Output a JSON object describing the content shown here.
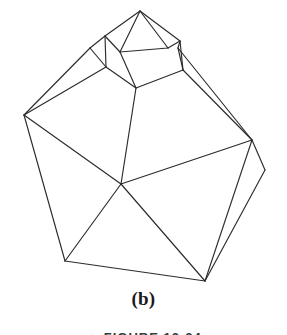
{
  "figure": {
    "caption": "(b)",
    "figure_reference": "▲ FIGURE 12-24",
    "line_color": "#2b2b2b",
    "background_color": "#ffffff",
    "stroke_width": 1.15
  },
  "geometry": {
    "type": "wireframe-polyhedron",
    "vertices": {
      "apex": [
        140,
        11
      ],
      "cap_left": [
        105,
        36
      ],
      "cap_right": [
        180,
        41
      ],
      "cap_front_left": [
        120,
        52
      ],
      "cap_front_right": [
        168,
        48
      ],
      "neck_left": [
        106,
        67
      ],
      "neck_right": [
        183,
        70
      ],
      "neck_front": [
        136,
        88
      ],
      "shoulder_left": [
        90,
        48
      ],
      "shoulder_right": [
        178,
        48
      ],
      "body_left": [
        24,
        115
      ],
      "body_right": [
        252,
        140
      ],
      "body_far_right": [
        265,
        170
      ],
      "center": [
        121,
        184
      ],
      "bottom_left": [
        65,
        261
      ],
      "bottom_right": [
        205,
        281
      ]
    },
    "edges": [
      [
        "apex",
        "cap_left"
      ],
      [
        "apex",
        "cap_right"
      ],
      [
        "apex",
        "cap_front_left"
      ],
      [
        "apex",
        "cap_front_right"
      ],
      [
        "cap_left",
        "cap_front_left"
      ],
      [
        "cap_front_left",
        "cap_front_right"
      ],
      [
        "cap_front_right",
        "cap_right"
      ],
      [
        "cap_left",
        "neck_left"
      ],
      [
        "cap_right",
        "neck_right"
      ],
      [
        "cap_front_left",
        "neck_front"
      ],
      [
        "neck_left",
        "neck_front"
      ],
      [
        "neck_front",
        "neck_right"
      ],
      [
        "cap_left",
        "shoulder_left"
      ],
      [
        "cap_right",
        "shoulder_right"
      ],
      [
        "shoulder_left",
        "neck_left"
      ],
      [
        "shoulder_right",
        "neck_right"
      ],
      [
        "shoulder_left",
        "body_left"
      ],
      [
        "shoulder_right",
        "body_right"
      ],
      [
        "neck_left",
        "body_left"
      ],
      [
        "neck_right",
        "body_right"
      ],
      [
        "neck_front",
        "center"
      ],
      [
        "body_left",
        "center"
      ],
      [
        "body_right",
        "center"
      ],
      [
        "body_left",
        "bottom_left"
      ],
      [
        "center",
        "bottom_left"
      ],
      [
        "center",
        "bottom_right"
      ],
      [
        "body_right",
        "bottom_right"
      ],
      [
        "body_right",
        "body_far_right"
      ],
      [
        "body_far_right",
        "bottom_right"
      ],
      [
        "bottom_left",
        "bottom_right"
      ]
    ]
  }
}
